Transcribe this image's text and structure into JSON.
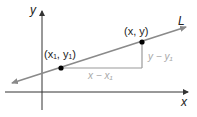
{
  "diagram": {
    "axes": {
      "x_label": "x",
      "y_label": "y"
    },
    "line": {
      "label": "L",
      "color": "#8a8a8a"
    },
    "points": [
      {
        "label": "(x₁, y₁)",
        "name": "point-x1-y1"
      },
      {
        "label": "(x, y)",
        "name": "point-x-y"
      }
    ],
    "legs": {
      "horizontal_label": "x − x₁",
      "vertical_label": "y − y₁",
      "color": "#9a9a9a"
    },
    "colors": {
      "axis": "#333333",
      "point": "#000000",
      "text": "#222222",
      "leg_text": "#a8a8a8"
    }
  }
}
